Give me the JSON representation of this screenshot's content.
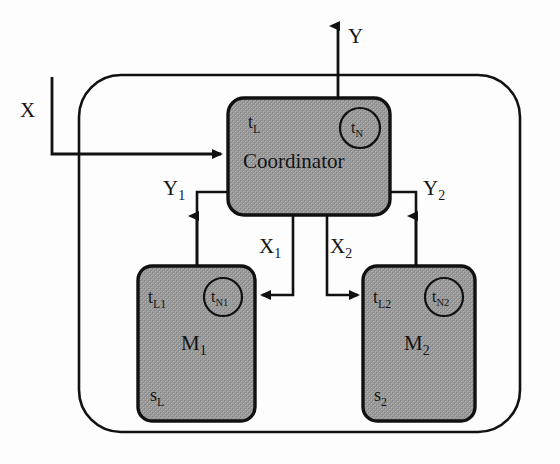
{
  "diagram": {
    "type": "block-diagram",
    "outer_container": {
      "name": "system-boundary",
      "shape": "rounded-rectangle",
      "fill": "#ffffff",
      "stroke": "#111111"
    },
    "blocks": [
      {
        "id": "coordinator",
        "name": "Coordinator",
        "label": "Coordinator",
        "tag_left": "t",
        "tag_left_sub": "L",
        "circle_tag": "t",
        "circle_tag_sub": "N",
        "fill": "#9c9c9c",
        "stroke": "#111111"
      },
      {
        "id": "module-1",
        "name": "M1",
        "label": "M",
        "label_sub": "1",
        "tag_left": "t",
        "tag_left_sub": "L1",
        "circle_tag": "t",
        "circle_tag_sub": "N1",
        "state_tag": "s",
        "state_tag_sub": "L",
        "fill": "#9c9c9c",
        "stroke": "#111111"
      },
      {
        "id": "module-2",
        "name": "M2",
        "label": "M",
        "label_sub": "2",
        "tag_left": "t",
        "tag_left_sub": "L2",
        "circle_tag": "t",
        "circle_tag_sub": "N2",
        "state_tag": "s",
        "state_tag_sub": "2",
        "fill": "#9c9c9c",
        "stroke": "#111111"
      }
    ],
    "signals": [
      {
        "id": "input-x",
        "label": "X",
        "sub": "",
        "direction": "into-coordinator",
        "from": "external",
        "to": "coordinator"
      },
      {
        "id": "output-y",
        "label": "Y",
        "sub": "",
        "direction": "out-of-system",
        "from": "coordinator",
        "to": "external"
      },
      {
        "id": "signal-y1",
        "label": "Y",
        "sub": "1",
        "direction": "up",
        "from": "module-1",
        "to": "coordinator"
      },
      {
        "id": "signal-y2",
        "label": "Y",
        "sub": "2",
        "direction": "up",
        "from": "module-2",
        "to": "coordinator"
      },
      {
        "id": "signal-x1",
        "label": "X",
        "sub": "1",
        "direction": "down-left",
        "from": "coordinator",
        "to": "module-1"
      },
      {
        "id": "signal-x2",
        "label": "X",
        "sub": "2",
        "direction": "down-right",
        "from": "coordinator",
        "to": "module-2"
      }
    ]
  },
  "labels": {
    "x_in": "X",
    "y_out": "Y",
    "y1": "Y",
    "y1_sub": "1",
    "y2": "Y",
    "y2_sub": "2",
    "x1": "X",
    "x1_sub": "1",
    "x2": "X",
    "x2_sub": "2",
    "coordinator": "Coordinator",
    "coord_tl": "t",
    "coord_tl_sub": "L",
    "coord_tn": "t",
    "coord_tn_sub": "N",
    "m1": "M",
    "m1_sub": "1",
    "m1_tl": "t",
    "m1_tl_sub": "L1",
    "m1_tn": "t",
    "m1_tn_sub": "N1",
    "m1_s": "s",
    "m1_s_sub": "L",
    "m2": "M",
    "m2_sub": "2",
    "m2_tl": "t",
    "m2_tl_sub": "L2",
    "m2_tn": "t",
    "m2_tn_sub": "N2",
    "m2_s": "s",
    "m2_s_sub": "2"
  },
  "colors": {
    "block_fill": "#9c9c9c",
    "stroke": "#111111",
    "background": "#fdfdfd",
    "text": "#141414"
  }
}
